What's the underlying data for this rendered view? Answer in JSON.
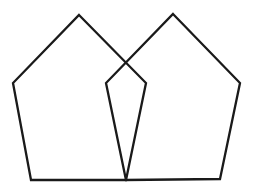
{
  "diagram": {
    "background": "#ffffff",
    "stroke_color": "#1a1a1a",
    "shapes": [
      {
        "name": "left-pentagon",
        "type": "pentagon",
        "points": "79,15 146,83 126,180 31,180 13,83"
      },
      {
        "name": "right-pentagon",
        "type": "pentagon",
        "points": "173,14 240,83 220,179 126,180 106,83"
      }
    ]
  }
}
